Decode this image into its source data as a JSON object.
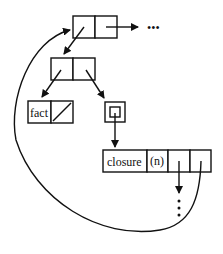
{
  "diagram": {
    "type": "memory-structure",
    "nodes": [
      {
        "id": "top-cons",
        "cells": [
          "",
          ""
        ]
      },
      {
        "id": "mid-cons",
        "cells": [
          "",
          ""
        ]
      },
      {
        "id": "fact-cell",
        "cells": [
          "fact",
          "/"
        ]
      },
      {
        "id": "ref-box",
        "cells": [
          ""
        ]
      },
      {
        "id": "closure-record",
        "cells": [
          "closure",
          "(n)",
          "",
          ""
        ]
      }
    ],
    "labels": {
      "fact": "fact",
      "closure": "closure",
      "arity": "(n)",
      "ellipsis_right": "•••",
      "ellipsis_down": "⋮"
    },
    "edges": [
      {
        "from": "top-cons.car",
        "to": "mid-cons"
      },
      {
        "from": "top-cons.cdr",
        "to": "ellipsis_right"
      },
      {
        "from": "mid-cons.car",
        "to": "fact-cell"
      },
      {
        "from": "mid-cons.cdr",
        "to": "ref-box"
      },
      {
        "from": "ref-box",
        "to": "closure-record"
      },
      {
        "from": "closure-record.cell3",
        "to": "ellipsis_down"
      },
      {
        "from": "closure-record.cell4",
        "to": "top-cons",
        "curved": true
      }
    ]
  }
}
